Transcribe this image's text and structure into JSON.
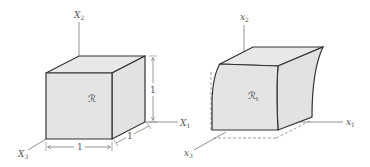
{
  "figure": {
    "reference_config": {
      "region_label": "ℛ",
      "axes": {
        "x1": {
          "base": "X",
          "sub": "1"
        },
        "x2": {
          "base": "X",
          "sub": "2"
        },
        "x3": {
          "base": "X",
          "sub": "3"
        }
      },
      "dimensions": {
        "width": "1",
        "depth": "1",
        "height": "1"
      }
    },
    "deformed_config": {
      "region_label": "ℛ",
      "region_sub": "t",
      "axes": {
        "x1": {
          "base": "x",
          "sub": "1"
        },
        "x2": {
          "base": "x",
          "sub": "2"
        },
        "x3": {
          "base": "x",
          "sub": "3"
        }
      }
    },
    "colors": {
      "face_fill": "#e4e4e4",
      "edge_stroke": "#333333",
      "axis_stroke": "#777777",
      "label": "#555555"
    }
  }
}
